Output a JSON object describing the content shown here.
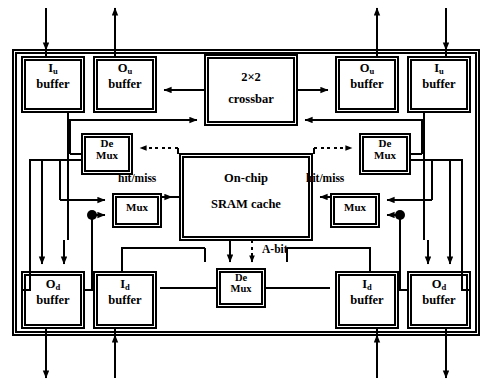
{
  "diagram": {
    "colors": {
      "line": "#000000",
      "background": "#ffffff",
      "fill": "#ffffff"
    },
    "chip": {
      "name": "chip-boundary"
    },
    "blocks": {
      "iu_left": {
        "line1": "I",
        "sub": "u",
        "line2": "buffer"
      },
      "ou_left": {
        "line1": "O",
        "sub": "u",
        "line2": "buffer"
      },
      "ou_right": {
        "line1": "O",
        "sub": "u",
        "line2": "buffer"
      },
      "iu_right": {
        "line1": "I",
        "sub": "u",
        "line2": "buffer"
      },
      "od_left": {
        "line1": "O",
        "sub": "d",
        "line2": "buffer"
      },
      "id_left": {
        "line1": "I",
        "sub": "d",
        "line2": "buffer"
      },
      "id_right": {
        "line1": "I",
        "sub": "d",
        "line2": "buffer"
      },
      "od_right": {
        "line1": "O",
        "sub": "d",
        "line2": "buffer"
      },
      "crossbar": {
        "line1": "2×2",
        "line2": "crossbar"
      },
      "cache": {
        "line1": "On-chip",
        "line2": "SRAM cache"
      },
      "demux_left": {
        "line1": "De",
        "line2": "Mux"
      },
      "demux_right": {
        "line1": "De",
        "line2": "Mux"
      },
      "demux_bottom": {
        "line1": "De",
        "line2": "Mux"
      },
      "mux_left": {
        "line1": "Mux"
      },
      "mux_right": {
        "line1": "Mux"
      }
    },
    "signals": {
      "hit_miss_left": "hit/miss",
      "hit_miss_right": "hit/miss",
      "a_bit": "A-bit"
    },
    "ports": {
      "top": [
        {
          "name": "iu-left-in",
          "direction": "in"
        },
        {
          "name": "ou-left-out",
          "direction": "out"
        },
        {
          "name": "ou-right-out",
          "direction": "out"
        },
        {
          "name": "iu-right-in",
          "direction": "in"
        }
      ],
      "bottom": [
        {
          "name": "od-left-out",
          "direction": "out"
        },
        {
          "name": "id-left-in",
          "direction": "in"
        },
        {
          "name": "id-right-in",
          "direction": "in"
        },
        {
          "name": "od-right-out",
          "direction": "out"
        }
      ]
    }
  }
}
